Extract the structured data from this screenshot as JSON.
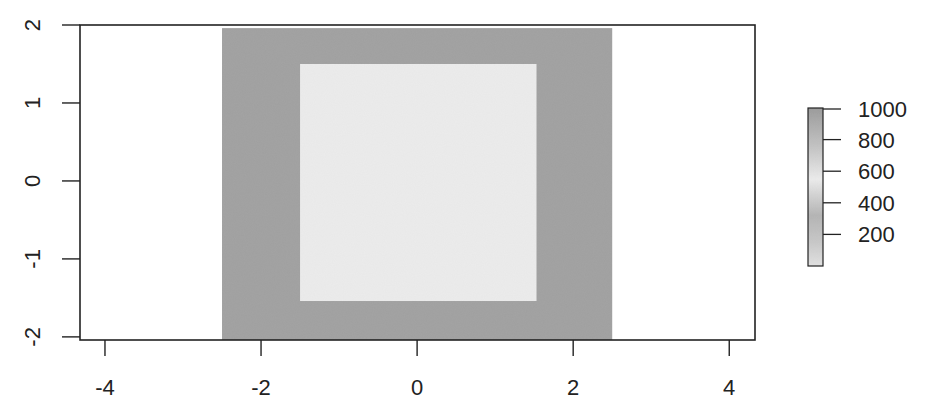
{
  "chart_data": {
    "type": "heatmap",
    "title": "",
    "xlabel": "",
    "ylabel": "",
    "xlim": [
      -4.32,
      4.33
    ],
    "ylim": [
      -2.04,
      2.0
    ],
    "x_ticks": [
      -4,
      -2,
      0,
      2,
      4
    ],
    "y_ticks": [
      -2,
      -1,
      0,
      1,
      2
    ],
    "x_tick_labels": [
      "-4",
      "-2",
      "0",
      "2",
      "4"
    ],
    "y_tick_labels": [
      "-2",
      "-1",
      "0",
      "1",
      "2"
    ],
    "grid": false,
    "background_value": null,
    "regions": [
      {
        "name": "outer-band",
        "x": [
          -2.5,
          2.5
        ],
        "y": [
          -2.04,
          1.96
        ],
        "value": 1000,
        "color": "#a0a0a0"
      },
      {
        "name": "inner-square",
        "x": [
          -1.5,
          1.53
        ],
        "y": [
          -1.54,
          1.5
        ],
        "value": 600,
        "color": "#ececec"
      }
    ],
    "legend": {
      "type": "colorbar",
      "position": "right",
      "range": [
        0,
        1000
      ],
      "ticks": [
        200,
        400,
        600,
        800,
        1000
      ],
      "tick_labels": [
        "200",
        "400",
        "600",
        "800",
        "1000"
      ],
      "gradient_stops": [
        {
          "value": 0,
          "color": "#e2e2e2"
        },
        {
          "value": 150,
          "color": "#c8c8c8"
        },
        {
          "value": 320,
          "color": "#b4b4b4"
        },
        {
          "value": 550,
          "color": "#ececec"
        },
        {
          "value": 750,
          "color": "#c4c4c4"
        },
        {
          "value": 1000,
          "color": "#9a9a9a"
        }
      ]
    }
  },
  "colors": {
    "axis": "#222222",
    "plot_background": "#ffffff",
    "band": "#a0a0a0",
    "square": "#ececec"
  }
}
